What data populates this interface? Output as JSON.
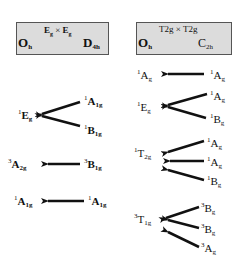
{
  "left_panel": {
    "header": {
      "product": "Eg × Eg",
      "product_parts": {
        "a": "E",
        "a_sub": "g",
        "op": "×",
        "b": "E",
        "b_sub": "g"
      },
      "target_group": {
        "main": "O",
        "sub": "h"
      },
      "source_group": {
        "main": "D",
        "sub": "4h"
      }
    },
    "correlations": [
      {
        "target": {
          "mult": "1",
          "sym": "E",
          "sub": "g"
        },
        "sources": [
          {
            "mult": "1",
            "sym": "A",
            "sub": "1g"
          },
          {
            "mult": "1",
            "sym": "B",
            "sub": "1g"
          }
        ]
      },
      {
        "target": {
          "mult": "3",
          "sym": "A",
          "sub": "2g"
        },
        "sources": [
          {
            "mult": "3",
            "sym": "B",
            "sub": "1g"
          }
        ]
      },
      {
        "target": {
          "mult": "1",
          "sym": "A",
          "sub": "1g"
        },
        "sources": [
          {
            "mult": "1",
            "sym": "A",
            "sub": "1g"
          }
        ]
      }
    ]
  },
  "right_panel": {
    "header": {
      "product": "T2g × T2g",
      "product_parts": {
        "a": "T2g",
        "op": "×",
        "b": "T2g"
      },
      "target_group": {
        "main": "O",
        "sub": "h"
      },
      "source_group": {
        "main": "C",
        "sub": "2h"
      }
    },
    "correlations": [
      {
        "target": {
          "mult": "1",
          "sym": "A",
          "sub": "g"
        },
        "sources": [
          {
            "mult": "1",
            "sym": "A",
            "sub": "g"
          }
        ]
      },
      {
        "target": {
          "mult": "1",
          "sym": "E",
          "sub": "g"
        },
        "sources": [
          {
            "mult": "1",
            "sym": "A",
            "sub": "g"
          },
          {
            "mult": "1",
            "sym": "B",
            "sub": "g"
          }
        ]
      },
      {
        "target": {
          "mult": "1",
          "sym": "T",
          "sub": "2g"
        },
        "sources": [
          {
            "mult": "1",
            "sym": "A",
            "sub": "g"
          },
          {
            "mult": "1",
            "sym": "A",
            "sub": "g"
          },
          {
            "mult": "1",
            "sym": "B",
            "sub": "g"
          }
        ]
      },
      {
        "target": {
          "mult": "3",
          "sym": "T",
          "sub": "1g"
        },
        "sources": [
          {
            "mult": "3",
            "sym": "B",
            "sub": "g"
          },
          {
            "mult": "3",
            "sym": "B",
            "sub": "g"
          },
          {
            "mult": "3",
            "sym": "A",
            "sub": "g"
          }
        ]
      }
    ]
  },
  "colors": {
    "box_fill": "#dcdcdc",
    "box_border": "#555555",
    "ink": "#111111"
  }
}
